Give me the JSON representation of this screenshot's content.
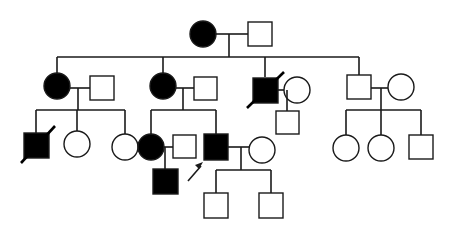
{
  "diagram": {
    "type": "pedigree",
    "title": "",
    "colors": {
      "affected": "#000000",
      "unaffected": "#ffffff",
      "line": "#1a1a1a"
    },
    "legend": {
      "filled": "affected",
      "open": "unaffected",
      "square": "male",
      "circle": "female",
      "slash": "deceased",
      "arrow": "proband"
    },
    "individuals": [
      {
        "id": "I-1",
        "sex": "female",
        "affected": true,
        "deceased": false,
        "x": 203,
        "y": 34
      },
      {
        "id": "I-2",
        "sex": "male",
        "affected": false,
        "deceased": false,
        "x": 260,
        "y": 34
      },
      {
        "id": "II-1",
        "sex": "female",
        "affected": true,
        "deceased": false,
        "x": 57,
        "y": 86
      },
      {
        "id": "II-2",
        "sex": "male",
        "affected": false,
        "deceased": false,
        "x": 102,
        "y": 88
      },
      {
        "id": "II-3",
        "sex": "female",
        "affected": true,
        "deceased": false,
        "x": 163,
        "y": 86
      },
      {
        "id": "II-4",
        "sex": "male",
        "affected": false,
        "deceased": false,
        "x": 205,
        "y": 88
      },
      {
        "id": "II-5",
        "sex": "male",
        "affected": true,
        "deceased": true,
        "x": 265,
        "y": 90
      },
      {
        "id": "II-6",
        "sex": "female",
        "affected": false,
        "deceased": false,
        "x": 297,
        "y": 90
      },
      {
        "id": "II-7",
        "sex": "male",
        "affected": false,
        "deceased": false,
        "x": 358,
        "y": 87
      },
      {
        "id": "II-8",
        "sex": "female",
        "affected": false,
        "deceased": false,
        "x": 401,
        "y": 87
      },
      {
        "id": "III-1",
        "sex": "male",
        "affected": true,
        "deceased": true,
        "x": 36,
        "y": 146
      },
      {
        "id": "III-2",
        "sex": "female",
        "affected": false,
        "deceased": false,
        "x": 77,
        "y": 144
      },
      {
        "id": "III-3",
        "sex": "female",
        "affected": false,
        "deceased": false,
        "x": 125,
        "y": 147
      },
      {
        "id": "III-4",
        "sex": "female",
        "affected": true,
        "deceased": false,
        "x": 151,
        "y": 147
      },
      {
        "id": "III-5",
        "sex": "male",
        "affected": false,
        "deceased": false,
        "x": 184,
        "y": 147
      },
      {
        "id": "III-6",
        "sex": "male",
        "affected": true,
        "deceased": false,
        "proband": true,
        "x": 216,
        "y": 147
      },
      {
        "id": "III-7",
        "sex": "female",
        "affected": false,
        "deceased": false,
        "x": 262,
        "y": 150
      },
      {
        "id": "III-8",
        "sex": "male",
        "affected": false,
        "deceased": false,
        "x": 288,
        "y": 123
      },
      {
        "id": "III-9",
        "sex": "female",
        "affected": false,
        "deceased": false,
        "x": 346,
        "y": 148
      },
      {
        "id": "III-10",
        "sex": "female",
        "affected": false,
        "deceased": false,
        "x": 381,
        "y": 148
      },
      {
        "id": "III-11",
        "sex": "male",
        "affected": false,
        "deceased": false,
        "x": 421,
        "y": 147
      },
      {
        "id": "IV-1",
        "sex": "male",
        "affected": true,
        "deceased": false,
        "x": 165,
        "y": 181
      },
      {
        "id": "IV-2",
        "sex": "male",
        "affected": false,
        "deceased": false,
        "x": 216,
        "y": 205
      },
      {
        "id": "IV-3",
        "sex": "male",
        "affected": false,
        "deceased": false,
        "x": 271,
        "y": 205
      }
    ]
  }
}
